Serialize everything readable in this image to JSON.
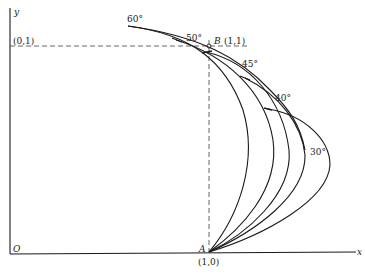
{
  "diagram": {
    "axes": {
      "x_label": "x",
      "y_label": "y",
      "origin_label": "O"
    },
    "points": {
      "A": {
        "name": "A",
        "coord": "(1,0)"
      },
      "B": {
        "name": "B",
        "coord": "(1,1)"
      },
      "C": {
        "coord": "(0,1)"
      }
    },
    "curves": [
      {
        "angle": "60°"
      },
      {
        "angle": "50°"
      },
      {
        "angle": "45°"
      },
      {
        "angle": "40°"
      },
      {
        "angle": "30°"
      }
    ],
    "colors": {
      "line": "#1a1a1a",
      "dashed": "#555555"
    }
  }
}
